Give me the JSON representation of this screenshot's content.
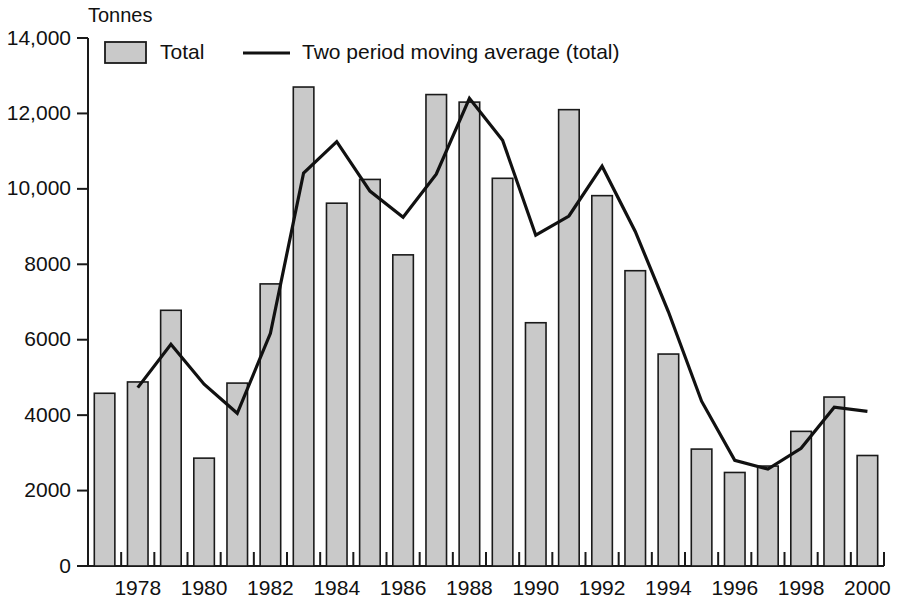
{
  "chart_data": {
    "type": "bar",
    "title": "",
    "subtitle": "",
    "xlabel": "",
    "ylabel": "Tonnes",
    "ylim": [
      0,
      14000
    ],
    "ytick_step": 2000,
    "ytick_labels": [
      "0",
      "2000",
      "4000",
      "6000",
      "8000",
      "10,000",
      "12,000",
      "14,000"
    ],
    "ytick_values": [
      0,
      2000,
      4000,
      6000,
      8000,
      10000,
      12000,
      14000
    ],
    "xlim": [
      1977,
      2000
    ],
    "xtick_labels": [
      "1978",
      "1980",
      "1982",
      "1984",
      "1986",
      "1988",
      "1990",
      "1992",
      "1994",
      "1996",
      "1998",
      "2000"
    ],
    "xtick_values": [
      1978,
      1980,
      1982,
      1984,
      1986,
      1988,
      1990,
      1992,
      1994,
      1996,
      1998,
      2000
    ],
    "grid": false,
    "legend_position": "top-left",
    "categories": [
      1977,
      1978,
      1979,
      1980,
      1981,
      1982,
      1983,
      1984,
      1985,
      1986,
      1987,
      1988,
      1989,
      1990,
      1991,
      1992,
      1993,
      1994,
      1995,
      1996,
      1997,
      1998,
      1999,
      2000
    ],
    "series": [
      {
        "name": "Total",
        "render": "bar",
        "color": "#c9c9c9",
        "values": [
          4580,
          4880,
          6780,
          2860,
          4850,
          7480,
          12700,
          9620,
          10250,
          8250,
          12500,
          12300,
          10280,
          6450,
          12100,
          9820,
          7830,
          5620,
          3100,
          2480,
          2650,
          3570,
          4480,
          2930
        ]
      },
      {
        "name": "Two period moving average (total)",
        "render": "line",
        "color": "#111111",
        "x": [
          1978,
          1979,
          1980,
          1981,
          1982,
          1983,
          1984,
          1985,
          1986,
          1987,
          1988,
          1989,
          1990,
          1991,
          1992,
          1993,
          1994,
          1995,
          1996,
          1997,
          1998,
          1999,
          2000
        ],
        "values": [
          4730,
          5880,
          4820,
          4050,
          6170,
          10420,
          11250,
          9940,
          9250,
          10390,
          12400,
          11290,
          8770,
          9280,
          10600,
          8870,
          6740,
          4370,
          2800,
          2570,
          3120,
          4210,
          4100
        ]
      }
    ]
  },
  "legend": {
    "items": [
      {
        "label": "Total",
        "marker": "swatch"
      },
      {
        "label": "Two period moving average (total)",
        "marker": "line"
      }
    ]
  },
  "axis": {
    "y_unit_label": "Tonnes"
  }
}
